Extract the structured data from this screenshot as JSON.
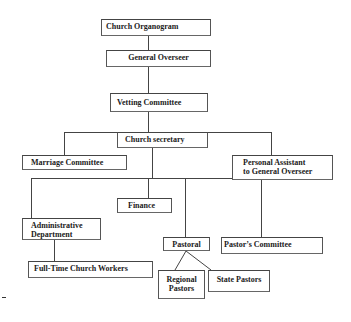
{
  "diagram": {
    "title": "Church Organogram",
    "type": "organizational-chart",
    "line_color": "#444444",
    "nodes": {
      "organogram": {
        "label": "Church Organogram"
      },
      "general_overseer": {
        "label": "General Overseer"
      },
      "vetting_committee": {
        "label": "Vetting Committee"
      },
      "church_secretary": {
        "label": "Church secretary"
      },
      "marriage_committee": {
        "label": "Marriage Committee"
      },
      "personal_assistant": {
        "line1": "Personal Assistant",
        "line2": "to General Overseer"
      },
      "finance": {
        "label": "Finance"
      },
      "administrative_department": {
        "line1": "Administrative",
        "line2": "Department"
      },
      "pastoral": {
        "label": "Pastoral"
      },
      "pastors_committee": {
        "label": "Pastor’s Committee"
      },
      "full_time_workers": {
        "label": "Full-Time Church Workers"
      },
      "regional_pastors": {
        "line1": "Regional",
        "line2": "Pastors"
      },
      "state_pastors": {
        "label": "State Pastors"
      }
    },
    "edges": [
      [
        "Church Organogram",
        "General Overseer"
      ],
      [
        "General Overseer",
        "Vetting Committee"
      ],
      [
        "Vetting Committee",
        "Church secretary"
      ],
      [
        "Church secretary",
        "Marriage Committee"
      ],
      [
        "Church secretary",
        "Personal Assistant to General Overseer"
      ],
      [
        "Church secretary",
        "Administrative Department"
      ],
      [
        "Church secretary",
        "Finance"
      ],
      [
        "Church secretary",
        "Pastoral"
      ],
      [
        "Church secretary",
        "Pastor’s Committee"
      ],
      [
        "Administrative Department",
        "Full-Time Church Workers"
      ],
      [
        "Pastoral",
        "Regional Pastors"
      ],
      [
        "Pastoral",
        "State Pastors"
      ]
    ]
  }
}
